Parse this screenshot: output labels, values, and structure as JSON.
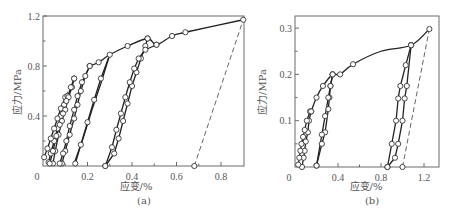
{
  "chart_data": [
    {
      "type": "line",
      "panel_label": "(a)",
      "xlabel": "应变/%",
      "ylabel": "应力/MPa",
      "xlim": [
        0,
        0.9
      ],
      "ylim": [
        0,
        1.2
      ],
      "xticks": [
        0,
        0.2,
        0.4,
        0.6,
        0.8
      ],
      "xtick_labels": [
        "0",
        "0.2",
        "0.4",
        "0.6",
        "0.8"
      ],
      "xminor": [
        0.1,
        0.3,
        0.5,
        0.7
      ],
      "yticks": [
        0.4,
        0.8,
        1.2
      ],
      "ytick_labels": [
        "0.4",
        "0.8",
        "1.2"
      ],
      "yminor": [
        0.2,
        0.6,
        1.0
      ],
      "origin_label": "0",
      "grid": false,
      "series": [
        {
          "name": "envelope",
          "style": "solid-smooth",
          "markers": true,
          "points": [
            [
              0.21,
              0.8
            ],
            [
              0.25,
              0.83
            ],
            [
              0.3,
              0.89
            ],
            [
              0.38,
              0.96
            ],
            [
              0.47,
              1.02
            ],
            [
              0.51,
              0.97
            ],
            [
              0.58,
              1.04
            ],
            [
              0.64,
              1.07
            ],
            [
              0.9,
              1.17
            ]
          ],
          "marker_points": [
            [
              0.25,
              0.83
            ],
            [
              0.38,
              0.96
            ],
            [
              0.47,
              1.02
            ],
            [
              0.51,
              0.97
            ],
            [
              0.58,
              1.04
            ],
            [
              0.64,
              1.07
            ],
            [
              0.9,
              1.17
            ]
          ]
        },
        {
          "name": "loop-1-unload",
          "style": "solid",
          "markers": true,
          "points": [
            [
              0.11,
              0.56
            ],
            [
              0.095,
              0.49
            ],
            [
              0.08,
              0.4
            ],
            [
              0.065,
              0.3
            ],
            [
              0.05,
              0.2
            ],
            [
              0.035,
              0.1
            ],
            [
              0.025,
              0.03
            ]
          ]
        },
        {
          "name": "loop-1-reload",
          "style": "solid",
          "markers": true,
          "points": [
            [
              0.005,
              0.07
            ],
            [
              0.02,
              0.14
            ],
            [
              0.035,
              0.22
            ],
            [
              0.05,
              0.3
            ],
            [
              0.065,
              0.38
            ],
            [
              0.08,
              0.46
            ],
            [
              0.1,
              0.55
            ],
            [
              0.11,
              0.56
            ]
          ]
        },
        {
          "name": "loop-2-unload",
          "style": "solid",
          "markers": true,
          "points": [
            [
              0.14,
              0.7
            ],
            [
              0.13,
              0.63
            ],
            [
              0.115,
              0.55
            ],
            [
              0.1,
              0.45
            ],
            [
              0.085,
              0.36
            ],
            [
              0.07,
              0.25
            ],
            [
              0.055,
              0.12
            ],
            [
              0.045,
              0.02
            ]
          ]
        },
        {
          "name": "loop-2-reload",
          "style": "solid",
          "markers": true,
          "points": [
            [
              0.03,
              0.02
            ],
            [
              0.045,
              0.12
            ],
            [
              0.06,
              0.24
            ],
            [
              0.075,
              0.33
            ],
            [
              0.09,
              0.42
            ],
            [
              0.105,
              0.52
            ],
            [
              0.125,
              0.63
            ],
            [
              0.14,
              0.7
            ]
          ]
        },
        {
          "name": "loop-3-unload",
          "style": "solid",
          "markers": true,
          "points": [
            [
              0.21,
              0.8
            ],
            [
              0.19,
              0.72
            ],
            [
              0.17,
              0.6
            ],
            [
              0.155,
              0.49
            ],
            [
              0.14,
              0.38
            ],
            [
              0.12,
              0.25
            ],
            [
              0.1,
              0.12
            ],
            [
              0.085,
              0.02
            ]
          ]
        },
        {
          "name": "loop-3-reload",
          "style": "solid",
          "markers": true,
          "points": [
            [
              0.075,
              0.02
            ],
            [
              0.09,
              0.1
            ],
            [
              0.105,
              0.2
            ],
            [
              0.12,
              0.32
            ],
            [
              0.14,
              0.45
            ],
            [
              0.155,
              0.56
            ],
            [
              0.175,
              0.67
            ],
            [
              0.21,
              0.8
            ]
          ]
        },
        {
          "name": "loop-4-unload",
          "style": "solid",
          "markers": true,
          "points": [
            [
              0.3,
              0.89
            ],
            [
              0.26,
              0.7
            ],
            [
              0.23,
              0.53
            ],
            [
              0.2,
              0.35
            ],
            [
              0.17,
              0.17
            ],
            [
              0.145,
              0.02
            ]
          ]
        },
        {
          "name": "loop-4-reload",
          "style": "solid",
          "markers": false,
          "points": [
            [
              0.14,
              0.02
            ],
            [
              0.18,
              0.22
            ],
            [
              0.22,
              0.45
            ],
            [
              0.26,
              0.66
            ],
            [
              0.3,
              0.89
            ]
          ]
        },
        {
          "name": "loop-5-unload",
          "style": "solid",
          "markers": true,
          "points": [
            [
              0.47,
              1.02
            ],
            [
              0.46,
              0.96
            ],
            [
              0.44,
              0.86
            ],
            [
              0.42,
              0.75
            ],
            [
              0.4,
              0.64
            ],
            [
              0.38,
              0.5
            ],
            [
              0.36,
              0.36
            ],
            [
              0.34,
              0.22
            ],
            [
              0.32,
              0.1
            ],
            [
              0.28,
              0.0
            ]
          ]
        },
        {
          "name": "loop-5-reload",
          "style": "solid",
          "markers": true,
          "points": [
            [
              0.28,
              0.0
            ],
            [
              0.31,
              0.15
            ],
            [
              0.33,
              0.29
            ],
            [
              0.35,
              0.42
            ],
            [
              0.37,
              0.55
            ],
            [
              0.39,
              0.67
            ],
            [
              0.41,
              0.78
            ],
            [
              0.43,
              0.86
            ],
            [
              0.46,
              0.93
            ],
            [
              0.51,
              0.97
            ]
          ]
        },
        {
          "name": "dashed-secant",
          "style": "dashed",
          "markers": true,
          "points": [
            [
              0.68,
              0.0
            ],
            [
              0.9,
              1.17
            ]
          ],
          "marker_points": [
            [
              0.68,
              0.0
            ]
          ]
        },
        {
          "name": "dashed-initial",
          "style": "dashed",
          "markers": false,
          "points": [
            [
              0.09,
              0.5
            ],
            [
              0.125,
              0.65
            ]
          ]
        }
      ]
    },
    {
      "type": "line",
      "panel_label": "(b)",
      "xlabel": "应变/%",
      "ylabel": "应力/MPa",
      "xlim": [
        0,
        1.3
      ],
      "ylim": [
        0,
        0.33
      ],
      "xticks": [
        0,
        0.4,
        0.8,
        1.2
      ],
      "xtick_labels": [
        "0",
        "0.4",
        "0.8",
        "1.2"
      ],
      "xminor": [
        0.2,
        0.6,
        1.0
      ],
      "yticks": [
        0.1,
        0.2,
        0.3
      ],
      "ytick_labels": [
        "0.1",
        "0.2",
        "0.3"
      ],
      "yminor": [
        0.05,
        0.15,
        0.25
      ],
      "origin_label": "0",
      "grid": false,
      "series": [
        {
          "name": "envelope",
          "style": "solid-smooth",
          "markers": true,
          "points": [
            [
              0.15,
              0.12
            ],
            [
              0.2,
              0.15
            ],
            [
              0.26,
              0.175
            ],
            [
              0.35,
              0.2
            ],
            [
              0.42,
              0.2
            ],
            [
              0.54,
              0.222
            ],
            [
              0.8,
              0.25
            ],
            [
              1.08,
              0.263
            ],
            [
              1.25,
              0.298
            ]
          ],
          "marker_points": [
            [
              0.2,
              0.15
            ],
            [
              0.26,
              0.175
            ],
            [
              0.35,
              0.2
            ],
            [
              0.42,
              0.2
            ],
            [
              0.54,
              0.222
            ],
            [
              1.08,
              0.263
            ],
            [
              1.25,
              0.298
            ]
          ]
        },
        {
          "name": "loop-1-unload",
          "style": "solid",
          "markers": true,
          "points": [
            [
              0.15,
              0.12
            ],
            [
              0.13,
              0.1
            ],
            [
              0.12,
              0.075
            ],
            [
              0.1,
              0.055
            ],
            [
              0.09,
              0.035
            ],
            [
              0.08,
              0.02
            ],
            [
              0.065,
              0.0
            ]
          ]
        },
        {
          "name": "loop-1-reload",
          "style": "solid",
          "markers": true,
          "points": [
            [
              0.03,
              0.005
            ],
            [
              0.04,
              0.02
            ],
            [
              0.05,
              0.035
            ],
            [
              0.06,
              0.05
            ],
            [
              0.075,
              0.065
            ],
            [
              0.09,
              0.08
            ],
            [
              0.11,
              0.1
            ],
            [
              0.14,
              0.12
            ],
            [
              0.15,
              0.12
            ]
          ]
        },
        {
          "name": "loop-2-unload",
          "style": "solid",
          "markers": true,
          "points": [
            [
              0.35,
              0.2
            ],
            [
              0.33,
              0.175
            ],
            [
              0.32,
              0.15
            ],
            [
              0.31,
              0.125
            ],
            [
              0.28,
              0.075
            ],
            [
              0.25,
              0.05
            ],
            [
              0.2,
              0.003
            ]
          ]
        },
        {
          "name": "loop-2-reload",
          "style": "solid",
          "markers": true,
          "points": [
            [
              0.2,
              0.003
            ],
            [
              0.25,
              0.07
            ],
            [
              0.28,
              0.11
            ],
            [
              0.31,
              0.15
            ],
            [
              0.33,
              0.175
            ],
            [
              0.35,
              0.2
            ]
          ]
        },
        {
          "name": "loop-3-unload",
          "style": "solid",
          "markers": true,
          "points": [
            [
              1.08,
              0.263
            ],
            [
              1.04,
              0.175
            ],
            [
              1.02,
              0.148
            ],
            [
              1.0,
              0.1
            ],
            [
              0.96,
              0.05
            ],
            [
              0.93,
              0.02
            ],
            [
              0.86,
              0.0
            ]
          ]
        },
        {
          "name": "loop-3-reload",
          "style": "solid",
          "markers": true,
          "points": [
            [
              0.86,
              0.0
            ],
            [
              0.9,
              0.05
            ],
            [
              0.94,
              0.1
            ],
            [
              0.96,
              0.148
            ],
            [
              0.98,
              0.175
            ],
            [
              1.03,
              0.22
            ],
            [
              1.08,
              0.263
            ]
          ]
        },
        {
          "name": "dashed-secant",
          "style": "dashed",
          "markers": true,
          "points": [
            [
              1.0,
              0.0
            ],
            [
              1.25,
              0.298
            ]
          ],
          "marker_points": [
            [
              1.0,
              0.0
            ]
          ]
        }
      ]
    }
  ]
}
